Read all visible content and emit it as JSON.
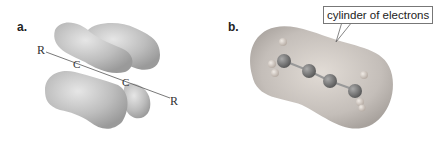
{
  "panel_a": {
    "label": "a.",
    "atoms": [
      "R",
      "C",
      "C",
      "R"
    ],
    "description": "pi-bond lobes of a carbon-carbon triple bond"
  },
  "panel_b": {
    "label": "b.",
    "callout": "cylinder of electrons",
    "description": "electrostatic potential surface of 2-butyne"
  },
  "colors": {
    "lobe": "#b9b9b9",
    "surface": "#c2bcb8",
    "carbon": "#777777",
    "hydrogen": "#d6cfc8"
  }
}
